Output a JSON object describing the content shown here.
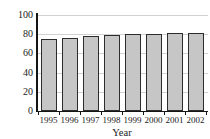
{
  "chart_data": {
    "type": "bar",
    "title": "",
    "xlabel": "Year",
    "ylabel": "Percent",
    "categories": [
      "1995",
      "1996",
      "1997",
      "1998",
      "1999",
      "2000",
      "2001",
      "2002"
    ],
    "values": [
      75,
      76,
      78,
      79,
      80.5,
      80.5,
      81.5,
      81.5
    ],
    "ylim": [
      0,
      100
    ],
    "yticks": [
      0,
      20,
      40,
      60,
      80,
      100
    ],
    "ytick_labels": [
      "0",
      "20",
      "40",
      "60",
      "80",
      "100"
    ],
    "grid": true,
    "grid_axis": "y",
    "legend": false,
    "legend_position": "none",
    "bar_fill_color": "#c6c6c6",
    "bar_edge_color": "#2c2c2c",
    "gridline_color": "#d2d2d2",
    "axis_color": "#141414",
    "background_color": "#ffffff"
  }
}
